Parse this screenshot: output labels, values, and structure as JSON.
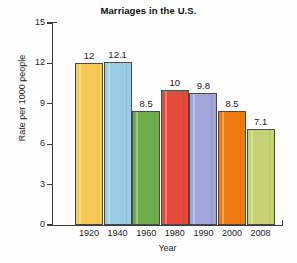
{
  "chart_data": {
    "type": "bar",
    "title": "Marriages in the U.S.",
    "xlabel": "Year",
    "ylabel": "Rate per 1000 people",
    "categories": [
      "1920",
      "1940",
      "1960",
      "1980",
      "1990",
      "2000",
      "2008"
    ],
    "values": [
      12,
      12.1,
      8.5,
      10,
      9.8,
      8.5,
      7.1
    ],
    "value_labels": [
      "12",
      "12.1",
      "8.5",
      "10",
      "9.8",
      "8.5",
      "7.1"
    ],
    "ylim": [
      0,
      15
    ],
    "yticks": [
      0,
      3,
      6,
      9,
      12,
      15
    ],
    "ytick_labels": [
      "0",
      "3",
      "6",
      "9",
      "12",
      "15"
    ],
    "grid": false,
    "legend": false,
    "bar_colors": [
      "#F3CB53",
      "#9CCDE6",
      "#6FAD4C",
      "#E8493D",
      "#A1A6DA",
      "#F07A12",
      "#C4D272"
    ],
    "bar_outline_color": "#4A4A4A",
    "axis_color": "#3B3B3B",
    "background_color": "#FEFEFE"
  }
}
